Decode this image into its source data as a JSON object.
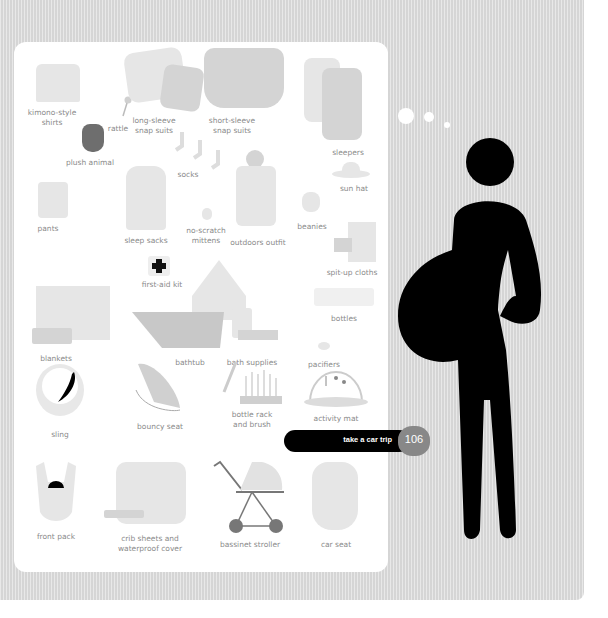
{
  "page": {
    "items": [
      {
        "id": "kimono-style-shirts",
        "label_lines": [
          "kimono-style",
          "shirts"
        ]
      },
      {
        "id": "rattle",
        "label_lines": [
          "rattle"
        ]
      },
      {
        "id": "long-sleeve-snap-suits",
        "label_lines": [
          "long-sleeve",
          "snap suits"
        ]
      },
      {
        "id": "short-sleeve-snap-suits",
        "label_lines": [
          "short-sleeve",
          "snap suits"
        ]
      },
      {
        "id": "sleepers",
        "label_lines": [
          "sleepers"
        ]
      },
      {
        "id": "plush-animal",
        "label_lines": [
          "plush animal"
        ]
      },
      {
        "id": "socks",
        "label_lines": [
          "socks"
        ]
      },
      {
        "id": "sun-hat",
        "label_lines": [
          "sun hat"
        ]
      },
      {
        "id": "pants",
        "label_lines": [
          "pants"
        ]
      },
      {
        "id": "sleep-sacks",
        "label_lines": [
          "sleep sacks"
        ]
      },
      {
        "id": "no-scratch-mittens",
        "label_lines": [
          "no-scratch",
          "mittens"
        ]
      },
      {
        "id": "outdoors-outfit",
        "label_lines": [
          "outdoors outfit"
        ]
      },
      {
        "id": "beanies",
        "label_lines": [
          "beanies"
        ]
      },
      {
        "id": "spit-up-cloths",
        "label_lines": [
          "spit-up cloths"
        ]
      },
      {
        "id": "first-aid-kit",
        "label_lines": [
          "first-aid kit"
        ]
      },
      {
        "id": "bottles",
        "label_lines": [
          "bottles"
        ]
      },
      {
        "id": "blankets",
        "label_lines": [
          "blankets"
        ]
      },
      {
        "id": "bathtub",
        "label_lines": [
          "bathtub"
        ]
      },
      {
        "id": "bath-supplies",
        "label_lines": [
          "bath supplies"
        ]
      },
      {
        "id": "pacifiers",
        "label_lines": [
          "pacifiers"
        ]
      },
      {
        "id": "sling",
        "label_lines": [
          "sling"
        ]
      },
      {
        "id": "bouncy-seat",
        "label_lines": [
          "bouncy seat"
        ]
      },
      {
        "id": "bottle-rack",
        "label_lines": [
          "bottle rack",
          "and brush"
        ]
      },
      {
        "id": "activity-mat",
        "label_lines": [
          "activity mat"
        ]
      },
      {
        "id": "front-pack",
        "label_lines": [
          "front pack"
        ]
      },
      {
        "id": "crib-sheets",
        "label_lines": [
          "crib sheets and",
          "waterproof cover"
        ]
      },
      {
        "id": "bassinet-stroller",
        "label_lines": [
          "bassinet stroller"
        ]
      },
      {
        "id": "car-seat",
        "label_lines": [
          "car seat"
        ]
      }
    ],
    "nav": {
      "link_label": "take a car trip",
      "page_number": "106"
    },
    "colors": {
      "background": "#dcdcdc",
      "panel": "#ffffff",
      "figure": "#000000",
      "badge": "#888888",
      "label": "#8a8a8a"
    }
  }
}
